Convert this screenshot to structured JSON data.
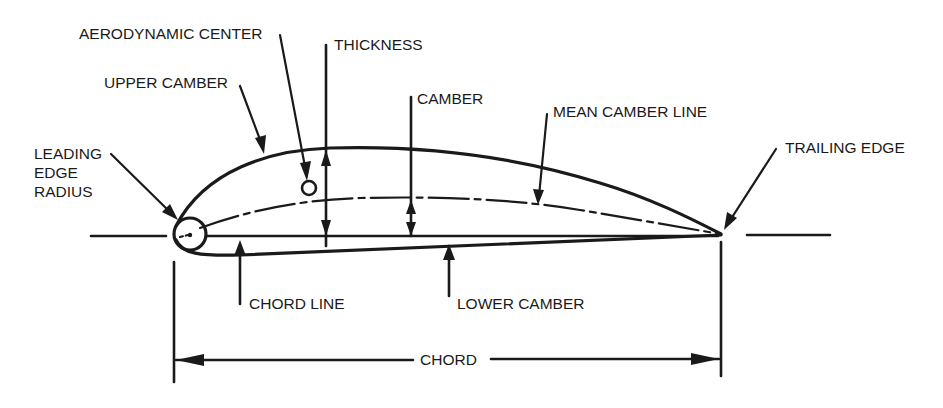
{
  "diagram": {
    "ink_color": "#1a1a1a",
    "background": "#ffffff",
    "labels": {
      "aerodynamic_center": "AERODYNAMIC CENTER",
      "thickness": "THICKNESS",
      "upper_camber": "UPPER CAMBER",
      "camber": "CAMBER",
      "mean_camber_line": "MEAN CAMBER LINE",
      "trailing_edge": "TRAILING EDGE",
      "leading_edge_radius_1": "LEADING",
      "leading_edge_radius_2": "EDGE",
      "leading_edge_radius_3": "RADIUS",
      "chord_line": "CHORD LINE",
      "lower_camber": "LOWER CAMBER",
      "chord": "CHORD"
    },
    "parts": [
      "leading-edge-radius-circle",
      "upper-surface",
      "lower-surface",
      "mean-camber-line",
      "chord-line",
      "aerodynamic-center-marker",
      "thickness-dimension",
      "camber-dimension",
      "chord-dimension"
    ]
  }
}
